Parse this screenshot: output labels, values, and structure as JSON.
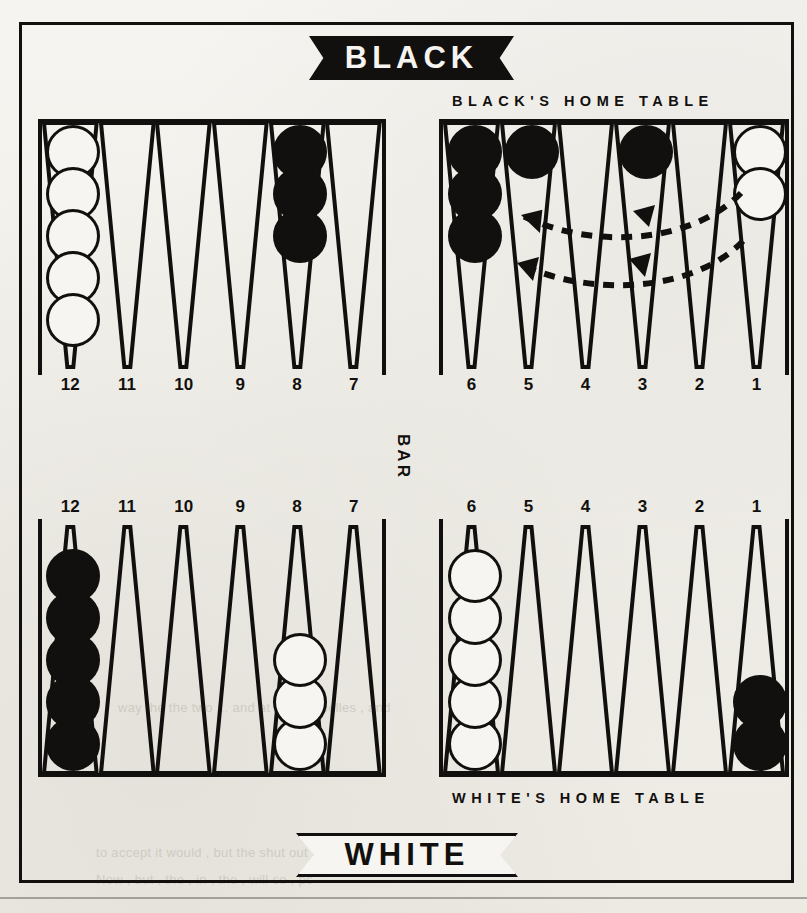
{
  "diagram": {
    "top_banner": "BLACK",
    "bottom_banner": "WHITE",
    "bar_label": "BAR",
    "black_home_caption": "BLACK'S HOME TABLE",
    "white_home_caption": "WHITE'S HOME TABLE",
    "colors": {
      "ink": "#12100e",
      "paper": "#f4f2ee",
      "black_checker": "#12100e",
      "white_checker": "#f7f5f1"
    }
  },
  "numbers": {
    "top_left": [
      "12",
      "11",
      "10",
      "9",
      "8",
      "7"
    ],
    "top_right": [
      "6",
      "5",
      "4",
      "3",
      "2",
      "1"
    ],
    "bottom_left": [
      "12",
      "11",
      "10",
      "9",
      "8",
      "7"
    ],
    "bottom_right": [
      "6",
      "5",
      "4",
      "3",
      "2",
      "1"
    ]
  },
  "board_state": {
    "top_left_quadrant": [
      {
        "point": "12",
        "color": "white",
        "count": 5
      },
      {
        "point": "11",
        "color": "none",
        "count": 0
      },
      {
        "point": "10",
        "color": "none",
        "count": 0
      },
      {
        "point": "9",
        "color": "none",
        "count": 0
      },
      {
        "point": "8",
        "color": "black",
        "count": 3
      },
      {
        "point": "7",
        "color": "none",
        "count": 0
      }
    ],
    "top_right_quadrant": [
      {
        "point": "6",
        "color": "black",
        "count": 3
      },
      {
        "point": "5",
        "color": "black",
        "count": 1
      },
      {
        "point": "4",
        "color": "none",
        "count": 0
      },
      {
        "point": "3",
        "color": "black",
        "count": 1
      },
      {
        "point": "2",
        "color": "none",
        "count": 0
      },
      {
        "point": "1",
        "color": "white",
        "count": 2
      }
    ],
    "bottom_left_quadrant": [
      {
        "point": "12",
        "color": "black",
        "count": 5
      },
      {
        "point": "11",
        "color": "none",
        "count": 0
      },
      {
        "point": "10",
        "color": "none",
        "count": 0
      },
      {
        "point": "9",
        "color": "none",
        "count": 0
      },
      {
        "point": "8",
        "color": "white",
        "count": 3
      },
      {
        "point": "7",
        "color": "none",
        "count": 0
      }
    ],
    "bottom_right_quadrant": [
      {
        "point": "6",
        "color": "white",
        "count": 5
      },
      {
        "point": "5",
        "color": "none",
        "count": 0
      },
      {
        "point": "4",
        "color": "none",
        "count": 0
      },
      {
        "point": "3",
        "color": "none",
        "count": 0
      },
      {
        "point": "2",
        "color": "none",
        "count": 0
      },
      {
        "point": "1",
        "color": "black",
        "count": 2
      }
    ]
  },
  "move_arrows": [
    {
      "from_point": "1",
      "to_point": "3",
      "style": "dashed-curve",
      "direction": "right-to-left"
    },
    {
      "from_point": "1",
      "to_point": "5",
      "style": "dashed-curve",
      "direction": "right-to-left"
    }
  ],
  "background_text": {
    "line1": "dissing and , since , arrows , and",
    "line2": "Now , but , the , in , the , will so , ps",
    "line3": "way the the two ... and at the ... I belles , and",
    "line4": "to accept it would , but the shut out the on"
  }
}
